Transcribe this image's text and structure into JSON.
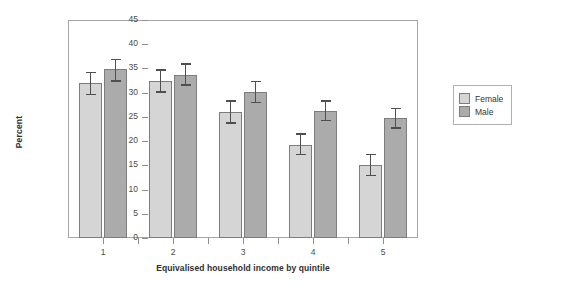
{
  "chart_data": {
    "type": "bar",
    "title": "",
    "xlabel": "Equivalised household income by quintile",
    "ylabel": "Percent",
    "categories": [
      "1",
      "2",
      "3",
      "4",
      "5"
    ],
    "ylim": [
      0,
      45
    ],
    "yticks": [
      0,
      5,
      10,
      15,
      20,
      25,
      30,
      35,
      40,
      45
    ],
    "ytick_labels": [
      "0",
      "5",
      "10",
      "15",
      "20",
      "25",
      "30",
      "35",
      "40",
      "45"
    ],
    "grid": false,
    "legend_position": "right",
    "series": [
      {
        "name": "Female",
        "color": "#d5d5d5",
        "values": [
          32.0,
          32.4,
          26.0,
          19.3,
          15.0
        ],
        "error_low": [
          29.5,
          30.0,
          23.6,
          17.1,
          12.8
        ],
        "error_high": [
          34.3,
          34.8,
          28.4,
          21.6,
          17.4
        ]
      },
      {
        "name": "Male",
        "color": "#ababab",
        "values": [
          34.8,
          33.7,
          30.1,
          26.2,
          24.8
        ],
        "error_low": [
          32.3,
          31.4,
          27.8,
          24.1,
          22.6
        ],
        "error_high": [
          37.0,
          36.1,
          32.5,
          28.4,
          26.9
        ]
      }
    ]
  },
  "legend": {
    "items": [
      {
        "label": "Female"
      },
      {
        "label": "Male"
      }
    ]
  }
}
